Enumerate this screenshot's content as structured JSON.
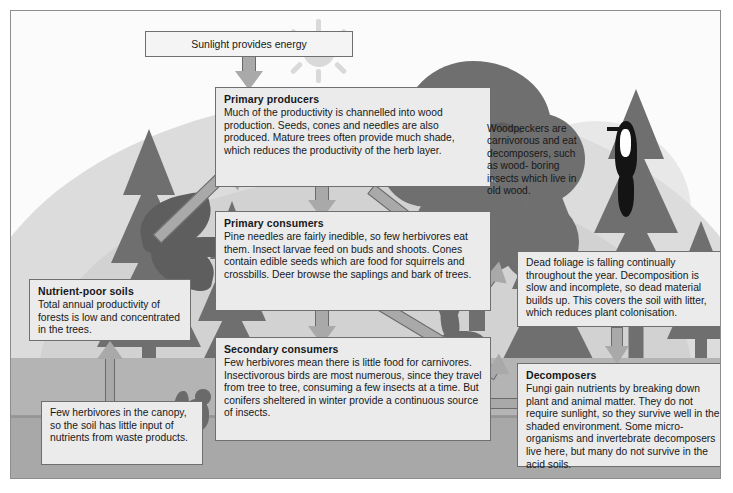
{
  "diagram": {
    "frame_border_color": "#8d8d8d",
    "box_fill": "#ebebeb",
    "arrow_fill": "#a9a9a9",
    "arrow_stroke": "#6a6a6a"
  },
  "sunlight": {
    "label": "Sunlight provides energy"
  },
  "boxes": {
    "primary_producers": {
      "title": "Primary producers",
      "body": "Much of the productivity is channelled into wood production. Seeds, cones and needles are also produced. Mature trees often provide much shade, which reduces the productivity of the herb layer."
    },
    "primary_consumers": {
      "title": "Primary consumers",
      "body": "Pine needles are fairly inedible, so few herbivores eat them. Insect larvae feed on buds and shoots. Cones contain edible seeds which are food for squirrels and crossbills. Deer browse the saplings and bark of trees."
    },
    "secondary_consumers": {
      "title": "Secondary consumers",
      "body": "Few herbivores mean there is little food for carnivores. Insectivorous birds are most numerous, since they travel from tree to tree, consuming a few insects at a time. But conifers sheltered in winter provide a continuous source of insects."
    },
    "decomposers": {
      "title": "Decomposers",
      "body": "Fungi gain nutrients by breaking down plant and animal matter. They do not require sunlight, so they survive well in the shaded environment. Some micro-organisms and invertebrate decomposers live here, but many do not survive in the acid soils."
    },
    "nutrient_poor_soils": {
      "title": "Nutrient-poor soils",
      "body": "Total annual productivity of forests is low and concentrated in the trees."
    },
    "dead_foliage": {
      "title": "",
      "body": "Dead foliage is falling continually throughout the year. Decomposition is slow and incomplete, so dead material builds up. This covers the soil with litter, which reduces plant colonisation."
    },
    "few_herbivores": {
      "title": "",
      "body": "Few herbivores in the canopy, so the soil has little input of nutrients from waste products."
    },
    "woodpeckers": {
      "title": "",
      "body": "Woodpeckers are carnivorous and eat decomposers, such as wood- boring insects which live in old wood."
    }
  },
  "icons": {
    "sun": "sun-icon",
    "conifer": "conifer-tree-icon",
    "broadleaf": "broadleaf-tree-icon",
    "bird_flying": "flying-bird-icon",
    "woodpecker": "woodpecker-icon",
    "deer": "deer-icon",
    "squirrel": "squirrel-icon",
    "soaring_bird": "soaring-bird-icon"
  },
  "arrows": [
    {
      "name": "sunlight-to-primary-producers",
      "from": "Sunlight provides energy",
      "to": "Primary producers",
      "direction": "down"
    },
    {
      "name": "primary-producers-to-primary-consumers",
      "from": "Primary producers",
      "to": "Primary consumers",
      "direction": "down"
    },
    {
      "name": "primary-consumers-to-secondary-consumers",
      "from": "Primary consumers",
      "to": "Secondary consumers",
      "direction": "down"
    },
    {
      "name": "secondary-consumers-to-decomposers",
      "from": "Secondary consumers",
      "to": "Decomposers",
      "direction": "right"
    },
    {
      "name": "primary-producers-to-dead-foliage",
      "from": "Primary producers",
      "to": "Dead foliage",
      "direction": "down-right"
    },
    {
      "name": "primary-consumers-to-decomposers",
      "from": "Primary consumers",
      "to": "Decomposers",
      "direction": "down-right"
    },
    {
      "name": "dead-foliage-to-decomposers",
      "from": "Dead foliage",
      "to": "Decomposers",
      "direction": "down"
    },
    {
      "name": "nutrient-poor-soils-to-primary-producers",
      "from": "Nutrient-poor soils",
      "to": "Primary producers",
      "direction": "up-right"
    },
    {
      "name": "few-herbivores-to-nutrient-poor-soils",
      "from": "Few herbivores in the canopy",
      "to": "Nutrient-poor soils",
      "direction": "up"
    }
  ]
}
